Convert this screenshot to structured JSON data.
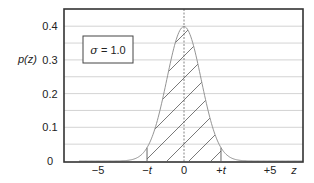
{
  "chart_data": {
    "type": "area",
    "title": "",
    "xlabel": "z",
    "ylabel": "p(z)",
    "xlim": [
      -6.2,
      7.0
    ],
    "ylim": [
      0,
      0.45
    ],
    "x_ticks": [
      {
        "value": -5,
        "label": "−5"
      },
      {
        "value": -2.15,
        "label": "−t"
      },
      {
        "value": 0,
        "label": "0"
      },
      {
        "value": 2.15,
        "label": "+t"
      },
      {
        "value": 5,
        "label": "+5"
      }
    ],
    "y_ticks": [
      {
        "value": 0,
        "label": "0"
      },
      {
        "value": 0.1,
        "label": "0.1"
      },
      {
        "value": 0.2,
        "label": "0.2"
      },
      {
        "value": 0.3,
        "label": "0.3"
      },
      {
        "value": 0.4,
        "label": "0.4"
      }
    ],
    "grid": {
      "horizontal": true,
      "step": 0.05,
      "vertical_at_zero": true
    },
    "annotation": "σ = 1.0",
    "series": [
      {
        "name": "p(z)",
        "distribution": "normal",
        "mean": 0,
        "sigma": 1.0,
        "x": [
          -6,
          -5,
          -4,
          -3,
          -2.5,
          -2,
          -1.5,
          -1,
          -0.5,
          0,
          0.5,
          1,
          1.5,
          2,
          2.5,
          3,
          4,
          5,
          6
        ],
        "values": [
          0.0,
          0.0,
          0.0001,
          0.0044,
          0.0175,
          0.054,
          0.1295,
          0.242,
          0.3521,
          0.3989,
          0.3521,
          0.242,
          0.1295,
          0.054,
          0.0175,
          0.0044,
          0.0001,
          0.0,
          0.0
        ]
      }
    ],
    "shaded_region": {
      "from": "-t",
      "to": "+t",
      "t_approx": 2.15,
      "style": "diagonal hatch"
    },
    "legend": null
  },
  "labels": {
    "ylabel": "p(z)",
    "xlabel": "z",
    "sigma_box": "σ = 1.0",
    "sigma_symbol": "σ",
    "sigma_value": " = 1.0"
  },
  "colors": {
    "frame": "#333333",
    "grid": "#c8c8c8",
    "curve": "#888888",
    "hatch": "#555555",
    "text": "#222222"
  }
}
